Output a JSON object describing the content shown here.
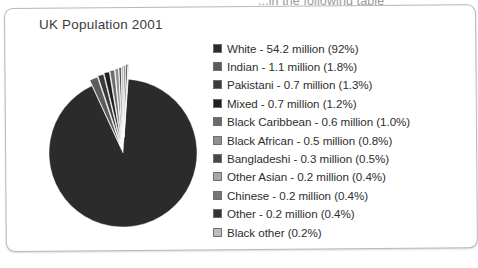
{
  "document": {
    "cutoff_text": "...in the following table"
  },
  "card": {
    "title": "UK Population 2001"
  },
  "chart_data": {
    "type": "pie",
    "title": "UK Population 2001",
    "xlabel": "",
    "ylabel": "",
    "legend_position": "right",
    "grid": false,
    "unit": "million",
    "total_population_million": 58.8,
    "categories": [
      "White",
      "Indian",
      "Pakistani",
      "Mixed",
      "Black Caribbean",
      "Black African",
      "Bangladeshi",
      "Other Asian",
      "Chinese",
      "Other",
      "Black other"
    ],
    "values": [
      54.2,
      1.1,
      0.7,
      0.7,
      0.6,
      0.5,
      0.3,
      0.2,
      0.2,
      0.2,
      0.12
    ],
    "percents": [
      92.0,
      1.8,
      1.3,
      1.2,
      1.0,
      0.8,
      0.5,
      0.4,
      0.4,
      0.4,
      0.2
    ],
    "colors": [
      "#2b2b2b",
      "#5c5c5c",
      "#3a3a3a",
      "#1f1f1f",
      "#6b6b6b",
      "#909090",
      "#474747",
      "#a8a8a8",
      "#777777",
      "#343434",
      "#bdbdbd"
    ],
    "slices": [
      {
        "label": "White",
        "value": 54.2,
        "percent": 92.0,
        "text": "White - 54.2 million (92%)",
        "color": "#2b2b2b",
        "exploded": false
      },
      {
        "label": "Indian",
        "value": 1.1,
        "percent": 1.8,
        "text": "Indian - 1.1 million (1.8%)",
        "color": "#5c5c5c",
        "exploded": true
      },
      {
        "label": "Pakistani",
        "value": 0.7,
        "percent": 1.3,
        "text": "Pakistani - 0.7 million (1.3%)",
        "color": "#3a3a3a",
        "exploded": true
      },
      {
        "label": "Mixed",
        "value": 0.7,
        "percent": 1.2,
        "text": "Mixed - 0.7 million (1.2%)",
        "color": "#1f1f1f",
        "exploded": true
      },
      {
        "label": "Black Caribbean",
        "value": 0.6,
        "percent": 1.0,
        "text": "Black Caribbean - 0.6 million (1.0%)",
        "color": "#6b6b6b",
        "exploded": true
      },
      {
        "label": "Black African",
        "value": 0.5,
        "percent": 0.8,
        "text": "Black African - 0.5 million (0.8%)",
        "color": "#909090",
        "exploded": true
      },
      {
        "label": "Bangladeshi",
        "value": 0.3,
        "percent": 0.5,
        "text": "Bangladeshi - 0.3 million (0.5%)",
        "color": "#474747",
        "exploded": true
      },
      {
        "label": "Other Asian",
        "value": 0.2,
        "percent": 0.4,
        "text": "Other Asian - 0.2 million (0.4%)",
        "color": "#a8a8a8",
        "exploded": true
      },
      {
        "label": "Chinese",
        "value": 0.2,
        "percent": 0.4,
        "text": "Chinese - 0.2 million (0.4%)",
        "color": "#777777",
        "exploded": true
      },
      {
        "label": "Other",
        "value": 0.2,
        "percent": 0.4,
        "text": "Other - 0.2 million (0.4%)",
        "color": "#343434",
        "exploded": true
      },
      {
        "label": "Black other",
        "value": 0.12,
        "percent": 0.2,
        "text": "Black other (0.2%)",
        "color": "#bdbdbd",
        "exploded": true
      }
    ]
  },
  "legend": {
    "items": [
      {
        "text": "White - 54.2 million (92%)",
        "color": "#2b2b2b"
      },
      {
        "text": "Indian - 1.1 million (1.8%)",
        "color": "#5c5c5c"
      },
      {
        "text": "Pakistani - 0.7 million (1.3%)",
        "color": "#3a3a3a"
      },
      {
        "text": "Mixed - 0.7 million (1.2%)",
        "color": "#1f1f1f"
      },
      {
        "text": "Black Caribbean - 0.6 million (1.0%)",
        "color": "#6b6b6b"
      },
      {
        "text": "Black African - 0.5 million (0.8%)",
        "color": "#909090"
      },
      {
        "text": "Bangladeshi - 0.3 million (0.5%)",
        "color": "#474747"
      },
      {
        "text": "Other Asian - 0.2 million (0.4%)",
        "color": "#a8a8a8"
      },
      {
        "text": "Chinese - 0.2 million (0.4%)",
        "color": "#777777"
      },
      {
        "text": "Other - 0.2 million (0.4%)",
        "color": "#343434"
      },
      {
        "text": "Black other (0.2%)",
        "color": "#bdbdbd"
      }
    ]
  }
}
